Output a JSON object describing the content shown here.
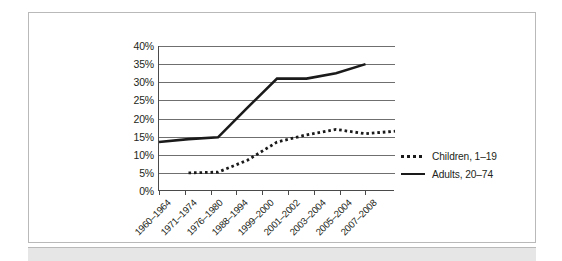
{
  "figure": {
    "title": "",
    "frame_color": "#b9b9b9",
    "footer_color": "#e6e6e6"
  },
  "legend": {
    "position": "right",
    "entries": [
      {
        "label": "Children, 1–19",
        "marker": "dotted-line-swatch"
      },
      {
        "label": "Adults, 20–74",
        "marker": "solid-line-swatch"
      }
    ]
  },
  "axes": {
    "y_ticks": [
      "0%",
      "5%",
      "10%",
      "15%",
      "20%",
      "25%",
      "30%",
      "35%",
      "40%"
    ],
    "x_ticks": [
      "1960–1964",
      "1971–1974",
      "1976–1980",
      "1988–1994",
      "1999–2000",
      "2001–2002",
      "2003–2004",
      "2005–2004",
      "2007–2008"
    ]
  },
  "chart_data": {
    "type": "line",
    "title": "",
    "subtitle": "",
    "xlabel": "",
    "ylabel": "",
    "ylim": [
      0,
      40
    ],
    "y_unit": "percent",
    "y_tick_step": 5,
    "grid": true,
    "legend_position": "right",
    "categories": [
      "1960–1964",
      "1971–1974",
      "1976–1980",
      "1988–1994",
      "1999–2000",
      "2001–2002",
      "2003–2004",
      "2005–2004",
      "2007–2008"
    ],
    "series": [
      {
        "name": "Adults, 20–74",
        "style": "solid",
        "values": [
          13.5,
          14.3,
          14.8,
          23.0,
          31.0,
          31.0,
          32.5,
          35.0,
          null
        ]
      },
      {
        "name": "Children, 1–19",
        "style": "dotted",
        "values": [
          null,
          5.0,
          5.2,
          8.5,
          13.5,
          15.5,
          17.0,
          15.8,
          16.5
        ]
      }
    ]
  }
}
